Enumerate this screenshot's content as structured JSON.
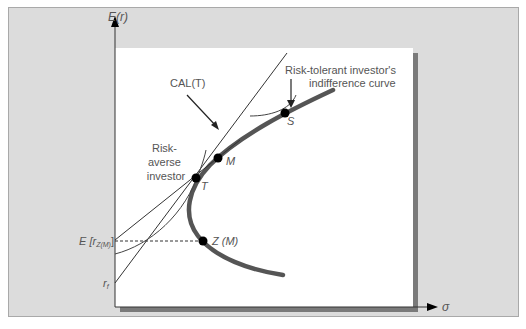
{
  "figure": {
    "y_axis_label": "E(r)",
    "x_axis_label": "σ",
    "cal_label": "CAL(T)",
    "risk_averse_label": [
      "Risk-",
      "averse",
      "investor"
    ],
    "risk_tolerant_label": [
      "Risk-tolerant investor's",
      "indifference curve"
    ],
    "points": {
      "T": "T",
      "M": "M",
      "S": "S",
      "ZM": "Z (M)"
    },
    "y_ticks": {
      "e_rzm": "E [r",
      "e_rzm_sub": "Z(M)",
      "e_rzm_close": "]",
      "rf": "r",
      "rf_sub": "f"
    }
  },
  "colors": {
    "panel_bg": "#dcdcdc",
    "plot_bg": "#ffffff",
    "shadow": "#7a7a7a",
    "frontier": "#555555",
    "thin_line": "#333333",
    "point": "#000000"
  }
}
